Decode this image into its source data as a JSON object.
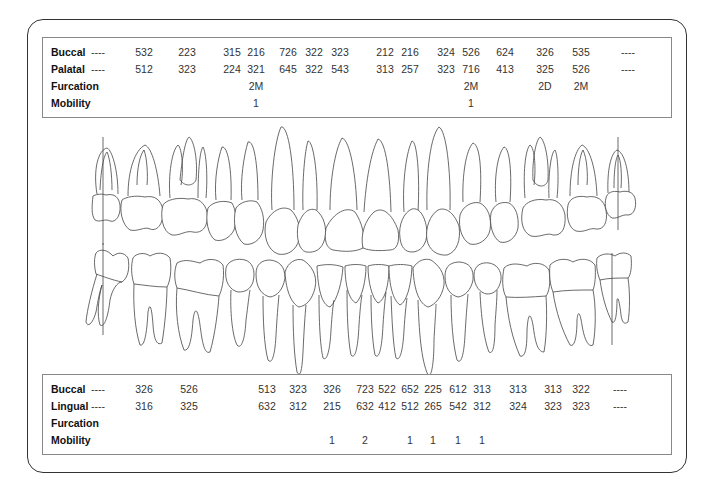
{
  "upper_chart": {
    "row_labels": [
      "Buccal",
      "Palatal",
      "Furcation",
      "Mobility"
    ],
    "columns_x": [
      97,
      143,
      186,
      231,
      255,
      287,
      313,
      339,
      384,
      409,
      445,
      470,
      504,
      544,
      580,
      627
    ],
    "buccal": [
      "----",
      "532",
      "223",
      "315",
      "216",
      "726",
      "322",
      "323",
      "212",
      "216",
      "324",
      "526",
      "624",
      "326",
      "535",
      "----"
    ],
    "palatal": [
      "----",
      "512",
      "323",
      "224",
      "321",
      "645",
      "322",
      "543",
      "313",
      "257",
      "323",
      "716",
      "413",
      "325",
      "526",
      "----"
    ],
    "furcation": [
      "",
      "",
      "",
      "",
      "2M",
      "",
      "",
      "",
      "",
      "",
      "",
      "2M",
      "",
      "2D",
      "2M",
      ""
    ],
    "mobility": [
      "",
      "",
      "",
      "",
      "1",
      "",
      "",
      "",
      "",
      "",
      "",
      "1",
      "",
      "",
      "",
      ""
    ]
  },
  "lower_chart": {
    "row_labels": [
      "Buccal",
      "Lingual",
      "Furcation",
      "Mobility"
    ],
    "columns_x": [
      97,
      143,
      188,
      266,
      297,
      331,
      364,
      386,
      409,
      432,
      457,
      481,
      517,
      552,
      580,
      619
    ],
    "buccal": [
      "----",
      "326",
      "526",
      "513",
      "323",
      "326",
      "723",
      "522",
      "652",
      "225",
      "612",
      "313",
      "313",
      "313",
      "322",
      "----"
    ],
    "lingual": [
      "----",
      "316",
      "325",
      "632",
      "312",
      "215",
      "632",
      "412",
      "512",
      "265",
      "542",
      "312",
      "324",
      "323",
      "323",
      "----"
    ],
    "furcation": [
      "",
      "",
      "",
      "",
      "",
      "",
      "",
      "",
      "",
      "",
      "",
      "",
      "",
      "",
      "",
      ""
    ],
    "mobility": [
      "",
      "",
      "",
      "",
      "",
      "1",
      "2",
      "",
      "1",
      "1",
      "1",
      "1",
      "",
      "",
      "",
      ""
    ]
  },
  "illustration": {
    "upper_arch": "maxillary teeth outline",
    "lower_arch": "mandibular teeth outline",
    "missing_markers": [
      "upper-right-third-molar",
      "upper-left-third-molar",
      "lower-right-third-molar",
      "lower-left-third-molar"
    ]
  }
}
